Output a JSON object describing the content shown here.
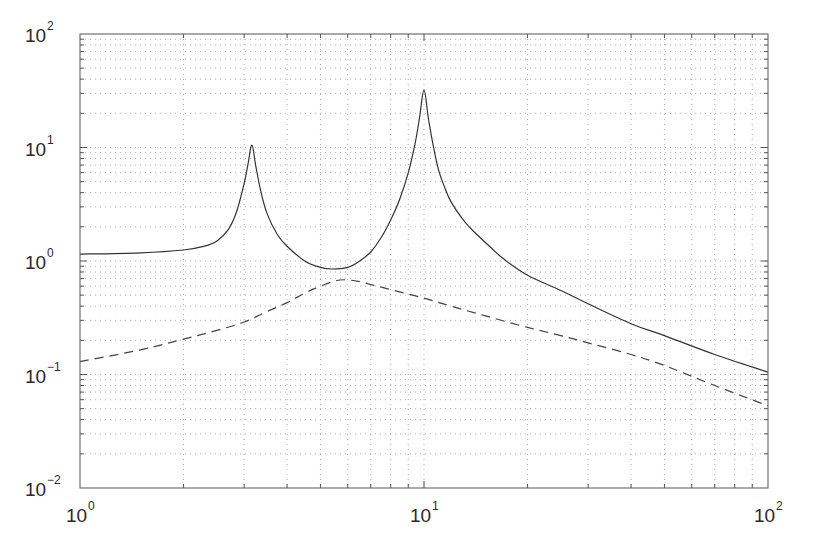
{
  "chart_data": {
    "type": "line",
    "title": "",
    "xlabel": "",
    "ylabel": "",
    "xscale": "log",
    "yscale": "log",
    "xlim": [
      1,
      100
    ],
    "ylim": [
      0.01,
      100
    ],
    "grid": true,
    "grid_style": "dotted minor",
    "legend": null,
    "x_tick_labels": [
      {
        "value": 1,
        "base": "10",
        "exp": "0"
      },
      {
        "value": 10,
        "base": "10",
        "exp": "1"
      },
      {
        "value": 100,
        "base": "10",
        "exp": "2"
      }
    ],
    "y_tick_labels": [
      {
        "value": 0.01,
        "base": "10",
        "exp": "-2"
      },
      {
        "value": 0.1,
        "base": "10",
        "exp": "-1"
      },
      {
        "value": 1,
        "base": "10",
        "exp": "0"
      },
      {
        "value": 10,
        "base": "10",
        "exp": "1"
      },
      {
        "value": 100,
        "base": "10",
        "exp": "2"
      }
    ],
    "series": [
      {
        "name": "solid",
        "style": "solid",
        "color": "#333333",
        "x": [
          1,
          1.5,
          2,
          2.3,
          2.5,
          2.7,
          2.85,
          3.0,
          3.08,
          3.16,
          3.24,
          3.35,
          3.5,
          3.75,
          4,
          4.5,
          5,
          5.4,
          6,
          6.5,
          7,
          7.5,
          8,
          8.5,
          9,
          9.4,
          9.7,
          10,
          10.3,
          10.6,
          11,
          11.5,
          12,
          13,
          14,
          15.5,
          17,
          20,
          25,
          30,
          40,
          50,
          70,
          100
        ],
        "values": [
          1.15,
          1.18,
          1.25,
          1.35,
          1.5,
          1.9,
          2.7,
          4.8,
          7.2,
          10.5,
          7.0,
          4.2,
          2.6,
          1.7,
          1.35,
          1.0,
          0.88,
          0.85,
          0.88,
          1.0,
          1.2,
          1.6,
          2.3,
          3.5,
          6.0,
          10.5,
          18,
          32,
          18,
          11,
          6.5,
          4.4,
          3.3,
          2.3,
          1.8,
          1.35,
          1.05,
          0.75,
          0.55,
          0.42,
          0.28,
          0.22,
          0.15,
          0.105
        ]
      },
      {
        "name": "dashed",
        "style": "dashed",
        "color": "#444444",
        "x": [
          1,
          1.5,
          2,
          2.5,
          3,
          3.5,
          4,
          4.5,
          5,
          5.7,
          6.5,
          7,
          8,
          10,
          12,
          15,
          20,
          25,
          30,
          40,
          50,
          70,
          100
        ],
        "values": [
          0.13,
          0.165,
          0.205,
          0.245,
          0.29,
          0.36,
          0.43,
          0.52,
          0.6,
          0.68,
          0.66,
          0.62,
          0.56,
          0.47,
          0.4,
          0.33,
          0.26,
          0.22,
          0.19,
          0.15,
          0.12,
          0.08,
          0.053
        ]
      }
    ]
  }
}
